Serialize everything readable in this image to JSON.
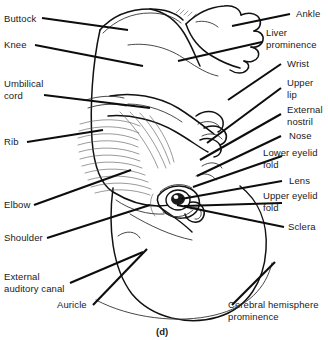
{
  "figure": {
    "caption": "(d)",
    "colors": {
      "background": "#ffffff",
      "ink": "#111111",
      "leader_line": "#0d0d0d",
      "text": "#1a1a1a"
    }
  },
  "labels_left": [
    {
      "id": "buttock",
      "text": "Buttock"
    },
    {
      "id": "knee",
      "text": "Knee"
    },
    {
      "id": "umbilical-cord",
      "text": "Umbilical\ncord"
    },
    {
      "id": "rib",
      "text": "Rib"
    },
    {
      "id": "elbow",
      "text": "Elbow"
    },
    {
      "id": "shoulder",
      "text": "Shoulder"
    },
    {
      "id": "external-auditory-canal",
      "text": "External\nauditory canal"
    },
    {
      "id": "auricle",
      "text": "Auricle"
    }
  ],
  "labels_right": [
    {
      "id": "ankle",
      "text": "Ankle"
    },
    {
      "id": "liver-prominence",
      "text": "Liver\nprominence"
    },
    {
      "id": "wrist",
      "text": "Wrist"
    },
    {
      "id": "upper-lip",
      "text": "Upper\nlip"
    },
    {
      "id": "external-nostril",
      "text": "External\nnostril"
    },
    {
      "id": "nose",
      "text": "Nose"
    },
    {
      "id": "lower-eyelid-fold",
      "text": "Lower eyelid\nfold"
    },
    {
      "id": "lens",
      "text": "Lens"
    },
    {
      "id": "upper-eyelid-fold",
      "text": "Upper eyelid\nfold"
    },
    {
      "id": "sclera",
      "text": "Sclera"
    }
  ],
  "labels_bottom": [
    {
      "id": "cerebral-hemisphere-prominence",
      "text": "Cerebral hemisphere\nprominence"
    }
  ]
}
